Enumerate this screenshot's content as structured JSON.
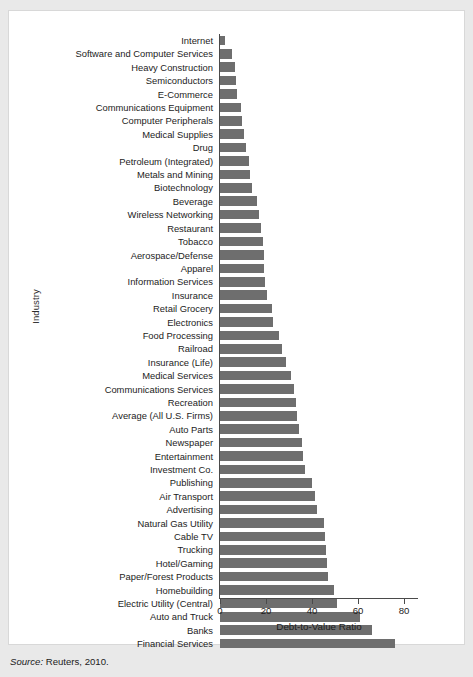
{
  "figure": {
    "source_label": "Source:",
    "source_text": " Reuters, 2010.",
    "bar_color": "#6e6e6e",
    "panel_background": "#ffffff",
    "page_background": "#e9e9e9"
  },
  "chart_data": {
    "type": "bar",
    "orientation": "horizontal",
    "title": "",
    "xlabel": "Debt-to-Value Ratio",
    "ylabel": "Industry",
    "xlim": [
      0,
      85
    ],
    "xticks": [
      0,
      20,
      40,
      60,
      80
    ],
    "xticklabels": [
      "0",
      "20",
      "40",
      "60",
      "80"
    ],
    "grid": false,
    "legend": null,
    "categories": [
      "Internet",
      "Software and Computer Services",
      "Heavy Construction",
      "Semiconductors",
      "E-Commerce",
      "Communications Equipment",
      "Computer Peripherals",
      "Medical  Supplies",
      "Drug",
      "Petroleum (Integrated)",
      "Metals and Mining",
      "Biotechnology",
      "Beverage",
      "Wireless Networking",
      "Restaurant",
      "Tobacco",
      "Aerospace/Defense",
      "Apparel",
      "Information Services",
      "Insurance",
      "Retail Grocery",
      "Electronics",
      "Food Processing",
      "Railroad",
      "Insurance (Life)",
      "Medical Services",
      "Communications Services",
      "Recreation",
      "Average (All U.S. Firms)",
      "Auto Parts",
      "Newspaper",
      "Entertainment",
      "Investment Co.",
      "Publishing",
      "Air Transport",
      "Advertising",
      "Natural Gas Utility",
      "Cable TV",
      "Trucking",
      "Hotel/Gaming",
      "Paper/Forest Products",
      "Homebuilding",
      "Electric Utility (Central)",
      "Auto and Truck",
      "Banks",
      "Financial Services"
    ],
    "values": [
      2.0,
      5.0,
      6.5,
      7.0,
      7.5,
      9.0,
      9.5,
      10.5,
      11.5,
      12.5,
      13.0,
      14.0,
      16.0,
      17.0,
      18.0,
      18.5,
      19.0,
      19.0,
      19.5,
      20.5,
      22.5,
      23.0,
      25.5,
      27.0,
      28.5,
      31.0,
      32.0,
      33.0,
      33.5,
      34.5,
      35.5,
      36.0,
      37.0,
      40.0,
      41.5,
      42.0,
      45.0,
      45.5,
      46.0,
      46.5,
      47.0,
      49.5,
      51.0,
      61.0,
      66.0,
      76.0
    ]
  }
}
